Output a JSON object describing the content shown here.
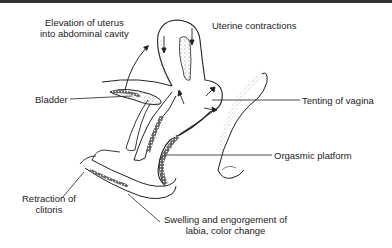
{
  "diagram": {
    "labels": {
      "elevation_line1": "Elevation of uterus",
      "elevation_line2": "into abdominal cavity",
      "uterine_contractions": "Uterine contractions",
      "bladder": "Bladder",
      "tenting": "Tenting of vagina",
      "orgasmic_platform": "Orgasmic platform",
      "retraction_line1": "Retraction of",
      "retraction_line2": "clitoris",
      "swelling_line1": "Swelling and engorgement of",
      "swelling_line2": "labia, color change"
    }
  }
}
